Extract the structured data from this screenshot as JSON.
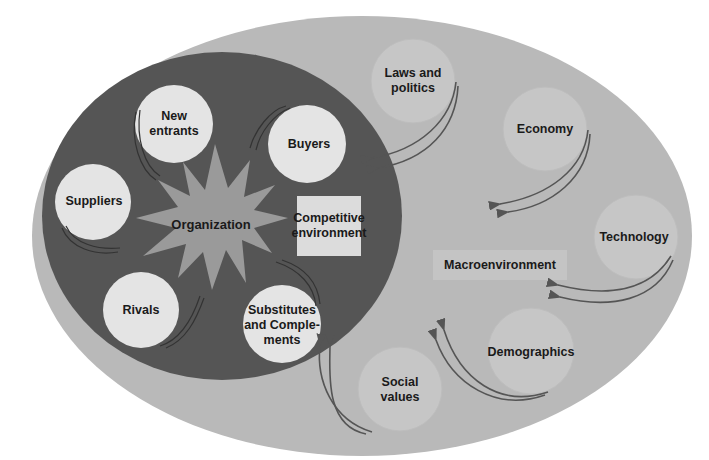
{
  "diagram": {
    "type": "nested environment diagram",
    "colors": {
      "background": "#ffffff",
      "outer_ellipse": "#b9b9b9",
      "inner_ellipse": "#555555",
      "starburst": "#9a9a9a",
      "competitive_circles": "#e4e4e4",
      "macro_circles": "#c6c6c6",
      "arrows": "#555555",
      "label_box_competitive": "#dcdcdc",
      "label_box_macro": "#c4c4c4"
    },
    "center": {
      "label": "Organization"
    },
    "competitive_environment": {
      "label": "Competitive environment",
      "label_lines": [
        "Competitive",
        "environment"
      ],
      "forces": [
        {
          "id": "new-entrants",
          "lines": [
            "New",
            "entrants"
          ]
        },
        {
          "id": "buyers",
          "lines": [
            "Buyers"
          ]
        },
        {
          "id": "suppliers",
          "lines": [
            "Suppliers"
          ]
        },
        {
          "id": "rivals",
          "lines": [
            "Rivals"
          ]
        },
        {
          "id": "substitutes",
          "lines": [
            "Substitutes",
            "and Comple-",
            "ments"
          ]
        }
      ]
    },
    "macroenvironment": {
      "label": "Macroenvironment",
      "forces": [
        {
          "id": "laws",
          "lines": [
            "Laws and",
            "politics"
          ]
        },
        {
          "id": "economy",
          "lines": [
            "Economy"
          ]
        },
        {
          "id": "technology",
          "lines": [
            "Technology"
          ]
        },
        {
          "id": "demographics",
          "lines": [
            "Demographics"
          ]
        },
        {
          "id": "social",
          "lines": [
            "Social",
            "values"
          ]
        }
      ]
    }
  }
}
